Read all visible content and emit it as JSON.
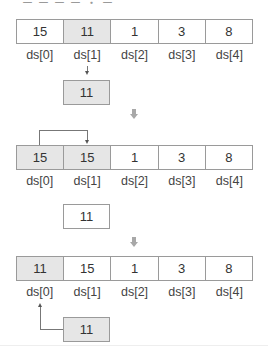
{
  "header": {
    "fragment": "ー ー ー ー ・ ー"
  },
  "colors": {
    "shaded_fill": "#e6e6e6",
    "border": "#9a9a9a",
    "step_arrow": "#a8a8a8"
  },
  "labels": [
    "ds[0]",
    "ds[1]",
    "ds[2]",
    "ds[3]",
    "ds[4]"
  ],
  "step1": {
    "array": [
      {
        "value": "15",
        "shaded": false
      },
      {
        "value": "11",
        "shaded": true
      },
      {
        "value": "1",
        "shaded": false
      },
      {
        "value": "3",
        "shaded": false
      },
      {
        "value": "8",
        "shaded": false
      }
    ],
    "temp": {
      "value": "11",
      "shaded": true
    },
    "annotation": "ds[1] copied down to temp"
  },
  "step2": {
    "array": [
      {
        "value": "15",
        "shaded": true
      },
      {
        "value": "15",
        "shaded": true
      },
      {
        "value": "1",
        "shaded": false
      },
      {
        "value": "3",
        "shaded": false
      },
      {
        "value": "8",
        "shaded": false
      }
    ],
    "temp": {
      "value": "11",
      "shaded": false
    },
    "annotation": "ds[0] shifted right into ds[1]"
  },
  "step3": {
    "array": [
      {
        "value": "11",
        "shaded": true
      },
      {
        "value": "15",
        "shaded": false
      },
      {
        "value": "1",
        "shaded": false
      },
      {
        "value": "3",
        "shaded": false
      },
      {
        "value": "8",
        "shaded": false
      }
    ],
    "temp": {
      "value": "11",
      "shaded": true
    },
    "annotation": "temp inserted into ds[0]"
  }
}
